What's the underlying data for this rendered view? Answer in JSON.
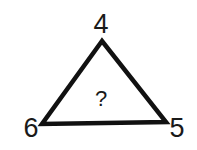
{
  "puzzle": {
    "shape": "triangle",
    "vertices": {
      "top": "4",
      "bottom_left": "6",
      "bottom_right": "5"
    },
    "center": "?"
  },
  "colors": {
    "stroke": "#111111",
    "text": "#1a1a1a",
    "background": "#ffffff"
  }
}
